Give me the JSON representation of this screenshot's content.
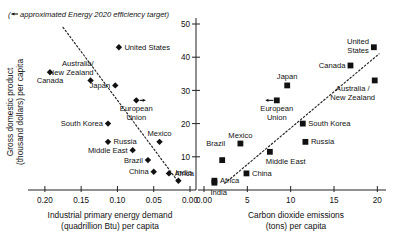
{
  "figure": {
    "note": "(← approximated Energy 2020 efficiency target)",
    "note_marker": "arrow-left-marker"
  },
  "yaxis": {
    "label_line1": "Gross domestic product",
    "label_line2": "(thousand dollars) per capita",
    "ticks": [
      "0",
      "10",
      "20",
      "30",
      "40",
      "50"
    ],
    "tick_values": [
      0,
      10,
      20,
      30,
      40,
      50
    ],
    "range": [
      0,
      50
    ]
  },
  "left_panel": {
    "xlabel_line1": "Industrial primary energy demand",
    "xlabel_line2": "(quadrillion Btu) per capita",
    "ticks": [
      "0.20",
      "0.15",
      "0.10",
      "0.05",
      "0.00"
    ],
    "tick_values": [
      0.2,
      0.15,
      0.1,
      0.05,
      0.0
    ],
    "range": [
      0.215,
      0.0
    ],
    "reversed": true,
    "marker": "diamond"
  },
  "right_panel": {
    "xlabel_line1": "Carbon dioxide emissions",
    "xlabel_line2": "(tons) per capita",
    "ticks": [
      "0.00",
      "5",
      "10",
      "15",
      "20"
    ],
    "tick_values": [
      0,
      5,
      10,
      15,
      20
    ],
    "range": [
      0,
      21
    ],
    "marker": "square"
  },
  "chart_data": {
    "type": "scatter",
    "title": "",
    "panels": [
      {
        "name": "left",
        "xlabel": "Industrial primary energy demand (quadrillion Btu) per capita",
        "ylabel": "Gross domestic product (thousand dollars) per capita",
        "xlim": [
          0.215,
          0.0
        ],
        "ylim": [
          0,
          50
        ],
        "x_reversed": true,
        "grid": false,
        "marker": "diamond",
        "trendline": {
          "type": "dashed",
          "x": [
            0.175,
            0.018
          ],
          "y": [
            49.0,
            3.0
          ]
        },
        "points": [
          {
            "label": "United States",
            "x": 0.098,
            "y": 43.0,
            "label_pos": "right"
          },
          {
            "label": "Canada",
            "x": 0.193,
            "y": 35.5,
            "label_pos": "below"
          },
          {
            "label": "Australia/\nNew Zealand",
            "x": 0.137,
            "y": 33.0,
            "label_pos": "above-left"
          },
          {
            "label": "Japan",
            "x": 0.103,
            "y": 31.5,
            "label_pos": "left"
          },
          {
            "label": "European\nUnion",
            "x": 0.074,
            "y": 27.0,
            "label_pos": "below",
            "arrow": "right"
          },
          {
            "label": "South Korea",
            "x": 0.113,
            "y": 20.0,
            "label_pos": "left"
          },
          {
            "label": "Russia",
            "x": 0.113,
            "y": 14.5,
            "label_pos": "right"
          },
          {
            "label": "Middle East",
            "x": 0.079,
            "y": 12.0,
            "label_pos": "left"
          },
          {
            "label": "Mexico",
            "x": 0.042,
            "y": 14.5,
            "label_pos": "above"
          },
          {
            "label": "Brazil",
            "x": 0.058,
            "y": 9.0,
            "label_pos": "left"
          },
          {
            "label": "China",
            "x": 0.05,
            "y": 5.5,
            "label_pos": "left"
          },
          {
            "label": "Africa",
            "x": 0.029,
            "y": 5.0,
            "label_pos": "right"
          },
          {
            "label": "India",
            "x": 0.016,
            "y": 2.8,
            "label_pos": "above-right"
          }
        ]
      },
      {
        "name": "right",
        "xlabel": "Carbon dioxide emissions (tons) per capita",
        "ylabel": "Gross domestic product (thousand dollars) per capita",
        "xlim": [
          0,
          21
        ],
        "ylim": [
          0,
          50
        ],
        "x_reversed": false,
        "grid": false,
        "marker": "square",
        "trendline": {
          "type": "dashed",
          "x": [
            2.4,
            20.2
          ],
          "y": [
            2.0,
            41.0
          ]
        },
        "points": [
          {
            "label": "United\nStates",
            "x": 19.6,
            "y": 43.0,
            "label_pos": "left"
          },
          {
            "label": "Canada",
            "x": 16.9,
            "y": 37.5,
            "label_pos": "left"
          },
          {
            "label": "Australia /\nNew Zealand",
            "x": 19.7,
            "y": 33.0,
            "label_pos": "below-left"
          },
          {
            "label": "Japan",
            "x": 9.6,
            "y": 31.5,
            "label_pos": "above"
          },
          {
            "label": "European\nUnion",
            "x": 8.4,
            "y": 27.0,
            "label_pos": "below",
            "arrow": "left"
          },
          {
            "label": "South Korea",
            "x": 11.4,
            "y": 20.0,
            "label_pos": "right"
          },
          {
            "label": "Russia",
            "x": 11.7,
            "y": 14.5,
            "label_pos": "right"
          },
          {
            "label": "Middle East",
            "x": 7.6,
            "y": 11.5,
            "label_pos": "below-right"
          },
          {
            "label": "Mexico",
            "x": 4.2,
            "y": 14.0,
            "label_pos": "above"
          },
          {
            "label": "Brazil",
            "x": 2.1,
            "y": 9.0,
            "label_pos": "above-left"
          },
          {
            "label": "China",
            "x": 4.9,
            "y": 5.0,
            "label_pos": "right"
          },
          {
            "label": "Africa",
            "x": 1.2,
            "y": 2.8,
            "label_pos": "right"
          },
          {
            "label": "India",
            "x": 1.2,
            "y": 2.2,
            "label_pos": "below-right"
          }
        ]
      }
    ]
  }
}
